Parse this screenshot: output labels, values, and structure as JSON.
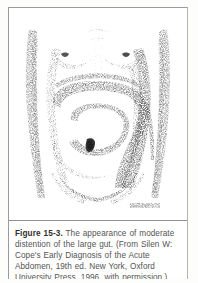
{
  "figure": {
    "label": "Figure 15-3.",
    "caption_text": "The appearance of moderate distention of the large gut. (From Silen W: Cope's Early Diagnosis of the Acute Abdomen, 19th ed. New York, Oxford University Press, 1996, with permission.)",
    "caption_full": "Figure 15-3. The appearance of moderate distention of the large gut. (From Silen W: Cope's Early Diagnosis of the Acute Abdomen, 19th ed. New York, Oxford University Press, 1996, with permission.)",
    "source_author": "Silen W",
    "source_title": "Cope's Early Diagnosis of the Acute Abdomen",
    "source_edition": "19th ed.",
    "source_city": "New York",
    "source_publisher": "Oxford University Press",
    "source_year": "1996",
    "source_permission": "with permission."
  },
  "illustration": {
    "subject": "female torso with moderate abdominal distention of the large gut",
    "medium": "stippled pen-and-ink medical illustration",
    "artist_signature": "artist signature",
    "regions": {
      "chest": "chest with breasts",
      "left_arm": "left arm",
      "right_arm": "right arm",
      "abdomen": "distended abdomen",
      "umbilicus": "umbilicus",
      "colon_loop": "distended large bowel loop outline",
      "pelvis": "pelvic brim"
    }
  },
  "colors": {
    "page_background": "#fdfdfc",
    "panel_background": "#ffffff",
    "border": "#9a9a9a",
    "ink": "#6b6b6b",
    "ink_dark": "#3c3c3c",
    "caption_text": "#545454",
    "caption_label": "#2f2f2f"
  }
}
